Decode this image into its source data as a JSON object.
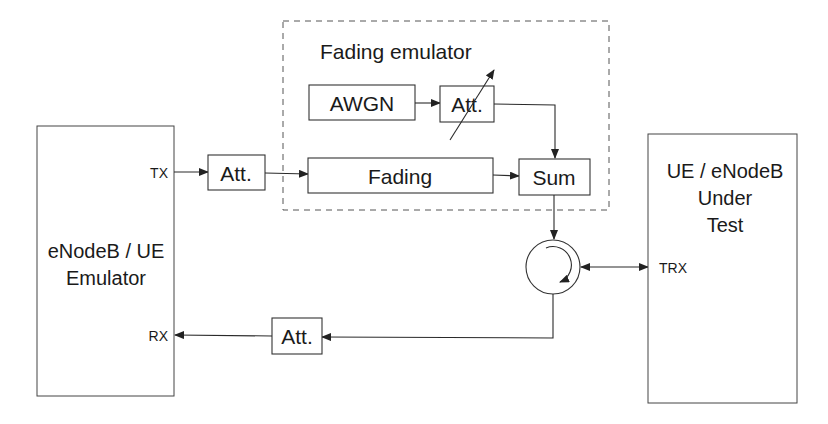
{
  "diagram": {
    "left_block": {
      "title_line1": "eNodeB / UE",
      "title_line2": "Emulator",
      "tx_port": "TX",
      "rx_port": "RX"
    },
    "right_block": {
      "title_line1": "UE / eNodeB",
      "title_line2": "Under",
      "title_line3": "Test",
      "trx_port": "TRX"
    },
    "tx_attenuator": "Att.",
    "rx_attenuator": "Att.",
    "fading_emulator": {
      "title": "Fading emulator",
      "awgn": "AWGN",
      "variable_attenuator": "Att.",
      "fading": "Fading",
      "sum": "Sum"
    },
    "circulator": "circulator"
  }
}
